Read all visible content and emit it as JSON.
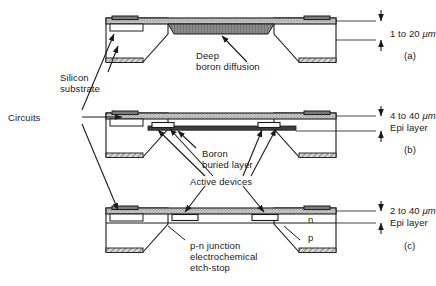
{
  "figure": {
    "type": "cross-section-diagram",
    "panel_count": 3
  },
  "shared_labels": {
    "circuits": "Circuits",
    "silicon_substrate": "Silicon\nsubstrate"
  },
  "panels": [
    {
      "id": "a",
      "tag": "(a)",
      "thickness": "1 to 20",
      "unit": "μm",
      "layer_name": "",
      "callout": "Deep\nboron diffusion",
      "technique": "deep boron diffusion etch-stop"
    },
    {
      "id": "b",
      "tag": "(b)",
      "thickness": "4 to 40",
      "unit": "μm",
      "layer_name": "Epi layer",
      "callout": "Boron\nburied layer",
      "callout2": "Active devices",
      "technique": "boron buried layer etch-stop"
    },
    {
      "id": "c",
      "tag": "(c)",
      "thickness": "2 to 40",
      "unit": "μm",
      "layer_name": "Epi layer",
      "callout": "p-n junction\nelectrochemical\netch-stop",
      "region_n": "n",
      "region_p": "p",
      "technique": "p-n junction electrochemical etch-stop"
    }
  ],
  "colors": {
    "ink": "#1a1a1a",
    "hatch_fill": "#c9c9c9",
    "boron_dark": "#6e6e6e",
    "buried_dark": "#4a4a4a",
    "white": "#ffffff"
  }
}
